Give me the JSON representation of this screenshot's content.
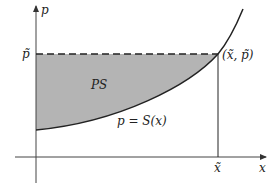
{
  "diagram": {
    "axes": {
      "y_label": "p",
      "x_label": "x"
    },
    "labels": {
      "p_tilde": "p̃",
      "x_tilde": "x̃",
      "region": "PS",
      "curve": "p = S(x)",
      "point": "(x̃, p̃)"
    },
    "colors": {
      "shade": "#b4b4b4",
      "line": "#222222",
      "axis": "#444444"
    }
  }
}
